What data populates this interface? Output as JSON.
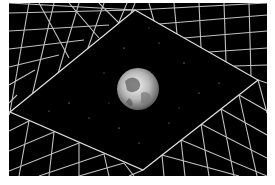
{
  "image": {
    "subject": "Earth in space framed by a perspective wireframe grid tunnel",
    "colors": {
      "background": "#ffffff",
      "space": "#000000",
      "grid": "#d8d8d8",
      "earth_ocean": "#6a6a6a",
      "earth_cloud": "#f2f2f2"
    }
  }
}
